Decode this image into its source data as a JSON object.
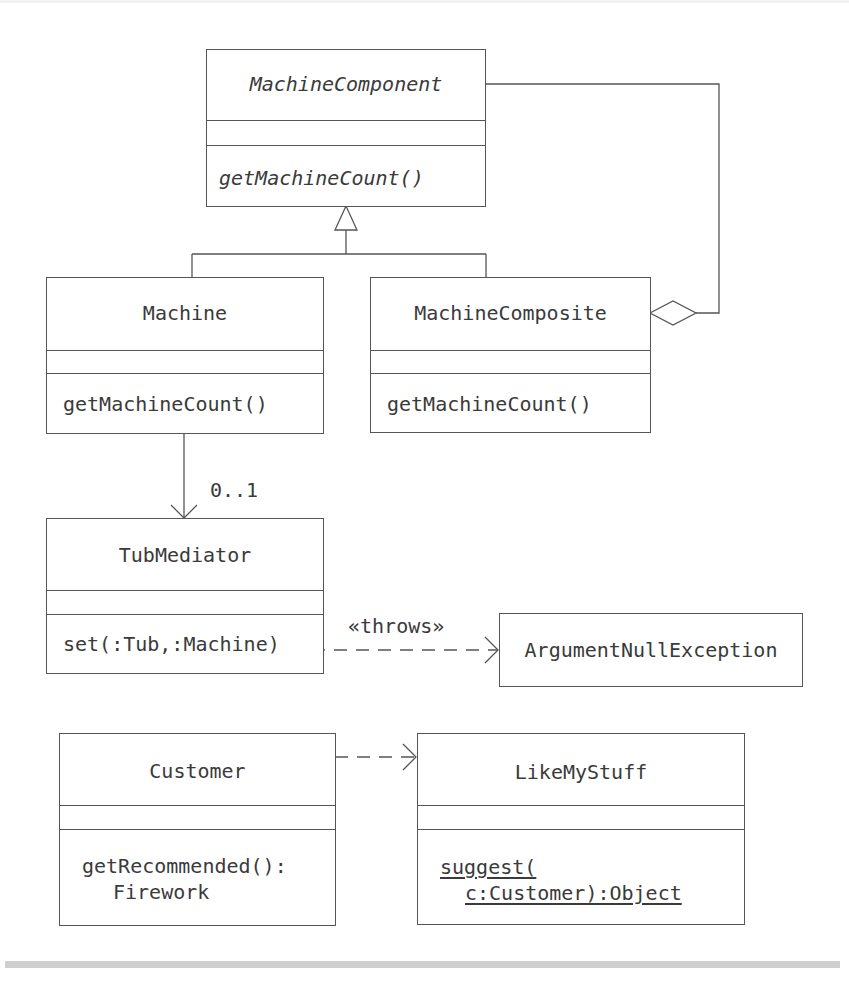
{
  "diagram": {
    "type": "UML class diagram",
    "classes": [
      {
        "id": "machine_component",
        "name": "MachineComponent",
        "abstract": true,
        "attributes": [],
        "operations": [
          "getMachineCount()"
        ]
      },
      {
        "id": "machine",
        "name": "Machine",
        "abstract": false,
        "attributes": [],
        "operations": [
          "getMachineCount()"
        ]
      },
      {
        "id": "machine_composite",
        "name": "MachineComposite",
        "abstract": false,
        "attributes": [],
        "operations": [
          "getMachineCount()"
        ]
      },
      {
        "id": "tub_mediator",
        "name": "TubMediator",
        "abstract": false,
        "attributes": [],
        "operations": [
          "set(:Tub,:Machine)"
        ]
      },
      {
        "id": "argument_null_exception",
        "name": "ArgumentNullException",
        "abstract": false
      },
      {
        "id": "customer",
        "name": "Customer",
        "abstract": false,
        "attributes": [],
        "operations": [
          "getRecommended():",
          "Firework"
        ]
      },
      {
        "id": "like_my_stuff",
        "name": "LikeMyStuff",
        "abstract": false,
        "attributes": [],
        "operations": [
          "suggest(",
          "c:Customer):Object"
        ],
        "static_operation": true
      }
    ],
    "relationships": [
      {
        "type": "generalization",
        "from": [
          "Machine",
          "MachineComposite"
        ],
        "to": "MachineComponent"
      },
      {
        "type": "aggregation",
        "whole": "MachineComposite",
        "part": "MachineComponent"
      },
      {
        "type": "navigable-association",
        "from": "Machine",
        "to": "TubMediator",
        "multiplicity": "0..1"
      },
      {
        "type": "dependency",
        "from": "TubMediator",
        "to": "ArgumentNullException",
        "stereotype": "«throws»"
      },
      {
        "type": "dependency",
        "from": "Customer",
        "to": "LikeMyStuff"
      }
    ],
    "labels": {
      "multiplicity": "0..1",
      "throws": "«throws»"
    },
    "colors": {
      "line": "#555555",
      "text": "#3a3a3a",
      "background": "#ffffff",
      "footer_bar": "#cfcfcf"
    }
  }
}
